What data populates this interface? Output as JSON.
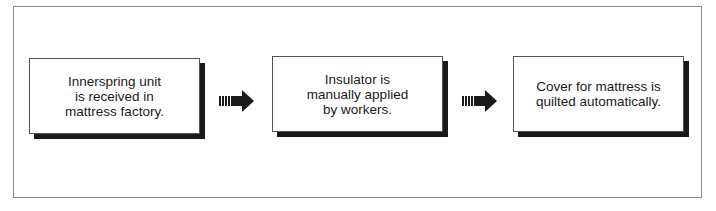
{
  "diagram": {
    "type": "process-flow",
    "steps": [
      {
        "label": "Innerspring unit\nis received in\nmattress factory."
      },
      {
        "label": "Insulator is\nmanually applied\nby workers."
      },
      {
        "label": "Cover for mattress is\nquilted automatically."
      }
    ],
    "connectors": [
      {
        "icon": "striped-arrow-right-icon",
        "from": 0,
        "to": 1
      },
      {
        "icon": "striped-arrow-right-icon",
        "from": 1,
        "to": 2
      }
    ],
    "colors": {
      "ink": "#1a1a1a",
      "frame": "#8a8a8a",
      "background": "#ffffff"
    }
  }
}
